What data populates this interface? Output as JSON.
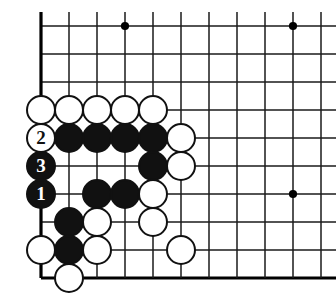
{
  "figure": {
    "name": "go-board-diagram",
    "colors": {
      "line": "#1a1a1a",
      "edge_line": "#000000",
      "board_background": "#ffffff",
      "black_stone": "#111111",
      "white_stone": "#ffffff",
      "star_point": "#000000"
    }
  },
  "board": {
    "origin_x": 41,
    "origin_y": 26,
    "spacing": 28,
    "cols": 11,
    "rows": 10,
    "edges": {
      "left": true,
      "bottom": true,
      "top": false,
      "right": false
    },
    "star_points": [
      {
        "col": 4,
        "row": 1
      },
      {
        "col": 10,
        "row": 1
      },
      {
        "col": 10,
        "row": 7
      }
    ]
  },
  "stones": [
    {
      "id": "w-c1-r4",
      "color": "white",
      "col": 1,
      "row": 4,
      "label": ""
    },
    {
      "id": "w-c2-r4",
      "color": "white",
      "col": 2,
      "row": 4,
      "label": ""
    },
    {
      "id": "w-c3-r4",
      "color": "white",
      "col": 3,
      "row": 4,
      "label": ""
    },
    {
      "id": "w-c4-r4",
      "color": "white",
      "col": 4,
      "row": 4,
      "label": ""
    },
    {
      "id": "w-c5-r4",
      "color": "white",
      "col": 5,
      "row": 4,
      "label": ""
    },
    {
      "id": "w-c1-r5",
      "color": "white",
      "col": 1,
      "row": 5,
      "label": "2"
    },
    {
      "id": "b-c2-r5",
      "color": "black",
      "col": 2,
      "row": 5,
      "label": ""
    },
    {
      "id": "b-c3-r5",
      "color": "black",
      "col": 3,
      "row": 5,
      "label": ""
    },
    {
      "id": "b-c4-r5",
      "color": "black",
      "col": 4,
      "row": 5,
      "label": ""
    },
    {
      "id": "b-c5-r5",
      "color": "black",
      "col": 5,
      "row": 5,
      "label": ""
    },
    {
      "id": "w-c6-r5",
      "color": "white",
      "col": 6,
      "row": 5,
      "label": ""
    },
    {
      "id": "b-c1-r6",
      "color": "black",
      "col": 1,
      "row": 6,
      "label": "3"
    },
    {
      "id": "b-c5-r6",
      "color": "black",
      "col": 5,
      "row": 6,
      "label": ""
    },
    {
      "id": "w-c6-r6",
      "color": "white",
      "col": 6,
      "row": 6,
      "label": ""
    },
    {
      "id": "b-c1-r7",
      "color": "black",
      "col": 1,
      "row": 7,
      "label": "1"
    },
    {
      "id": "b-c3-r7",
      "color": "black",
      "col": 3,
      "row": 7,
      "label": ""
    },
    {
      "id": "b-c4-r7",
      "color": "black",
      "col": 4,
      "row": 7,
      "label": ""
    },
    {
      "id": "w-c5-r7",
      "color": "white",
      "col": 5,
      "row": 7,
      "label": ""
    },
    {
      "id": "b-c2-r8",
      "color": "black",
      "col": 2,
      "row": 8,
      "label": ""
    },
    {
      "id": "w-c3-r8",
      "color": "white",
      "col": 3,
      "row": 8,
      "label": ""
    },
    {
      "id": "w-c5-r8",
      "color": "white",
      "col": 5,
      "row": 8,
      "label": ""
    },
    {
      "id": "w-c1-r9",
      "color": "white",
      "col": 1,
      "row": 9,
      "label": ""
    },
    {
      "id": "b-c2-r9",
      "color": "black",
      "col": 2,
      "row": 9,
      "label": ""
    },
    {
      "id": "w-c3-r9",
      "color": "white",
      "col": 3,
      "row": 9,
      "label": ""
    },
    {
      "id": "w-c6-r9",
      "color": "white",
      "col": 6,
      "row": 9,
      "label": ""
    },
    {
      "id": "w-c2-r10",
      "color": "white",
      "col": 2,
      "row": 10,
      "label": ""
    }
  ],
  "move_markers": [
    {
      "number": "1",
      "color": "black",
      "col": 1,
      "row": 7
    },
    {
      "number": "2",
      "color": "white",
      "col": 1,
      "row": 5
    },
    {
      "number": "3",
      "color": "black",
      "col": 1,
      "row": 6
    }
  ]
}
